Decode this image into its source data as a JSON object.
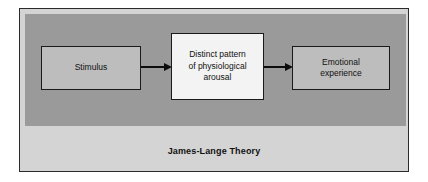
{
  "figure": {
    "caption": "James-Lange Theory",
    "colors": {
      "page_background": "#ffffff",
      "frame_border": "#2b2b2b",
      "panel_background": "#9a9a9a",
      "caption_band_background": "#d4d4d4",
      "side_node_fill": "#bdbdbd",
      "middle_node_fill": "#f3f3f3",
      "node_border": "#1a1a1a",
      "arrow_color": "#0d0d0d",
      "text_color": "#111111"
    }
  },
  "diagram": {
    "type": "flow",
    "direction": "left-to-right",
    "nodes": [
      {
        "id": "stimulus",
        "label": "Stimulus"
      },
      {
        "id": "arousal",
        "label": "Distinct pattern\nof physiological\narousal"
      },
      {
        "id": "emotion",
        "label": "Emotional\nexperience"
      }
    ],
    "edges": [
      {
        "id": "edge-1",
        "from": "stimulus",
        "to": "arousal"
      },
      {
        "id": "edge-2",
        "from": "arousal",
        "to": "emotion"
      }
    ]
  }
}
